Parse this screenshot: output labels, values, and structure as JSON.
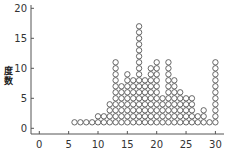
{
  "chart_data": {
    "type": "dotplot",
    "title": "",
    "xlabel": "",
    "ylabel": "度数",
    "xlim": [
      -1,
      31
    ],
    "ylim": [
      -1,
      20
    ],
    "x_ticks": [
      0,
      5,
      10,
      15,
      20,
      25,
      30
    ],
    "y_ticks": [
      0,
      5,
      10,
      15,
      20
    ],
    "grid": false,
    "x": [
      6,
      7,
      8,
      9,
      10,
      11,
      12,
      13,
      14,
      15,
      16,
      17,
      18,
      19,
      20,
      21,
      22,
      23,
      24,
      25,
      26,
      27,
      28,
      29,
      30
    ],
    "values": [
      1,
      1,
      1,
      1,
      2,
      2,
      4,
      11,
      7,
      9,
      8,
      17,
      8,
      10,
      11,
      5,
      11,
      8,
      6,
      5,
      5,
      2,
      3,
      1,
      11
    ],
    "colors": {
      "dot_stroke": "#444444",
      "axis": "#555555"
    }
  },
  "axis": {
    "y_label": "度数"
  }
}
